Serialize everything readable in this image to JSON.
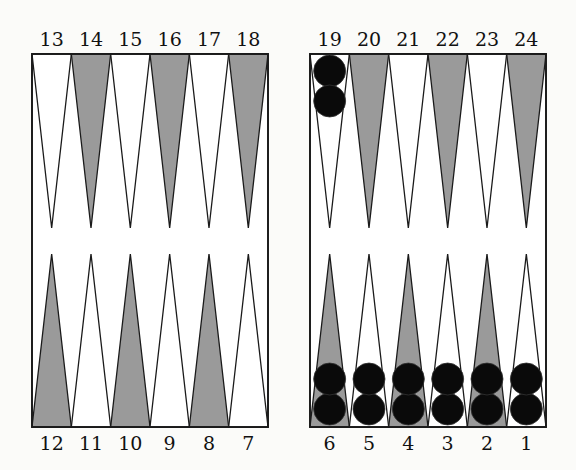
{
  "board": {
    "background": "#fbfbf9",
    "line_color": "#1a1a1a",
    "dark_point_color": "#9a9a9a",
    "light_point_color": "#ffffff",
    "checker_color": "#0a0a0a"
  },
  "labels": {
    "top_left": [
      "13",
      "14",
      "15",
      "16",
      "17",
      "18"
    ],
    "top_right": [
      "19",
      "20",
      "21",
      "22",
      "23",
      "24"
    ],
    "bottom_left": [
      "12",
      "11",
      "10",
      "9",
      "8",
      "7"
    ],
    "bottom_right": [
      "6",
      "5",
      "4",
      "3",
      "2",
      "1"
    ]
  },
  "points": {
    "top_left_shaded": [
      false,
      true,
      false,
      true,
      false,
      true
    ],
    "top_right_shaded": [
      false,
      true,
      false,
      true,
      false,
      true
    ],
    "bottom_left_shaded": [
      true,
      false,
      true,
      false,
      true,
      false
    ],
    "bottom_right_shaded": [
      true,
      false,
      true,
      false,
      true,
      false
    ]
  },
  "checkers": [
    {
      "point": "19",
      "count": 2
    },
    {
      "point": "6",
      "count": 2
    },
    {
      "point": "5",
      "count": 2
    },
    {
      "point": "4",
      "count": 2
    },
    {
      "point": "3",
      "count": 2
    },
    {
      "point": "2",
      "count": 2
    },
    {
      "point": "1",
      "count": 2
    }
  ]
}
